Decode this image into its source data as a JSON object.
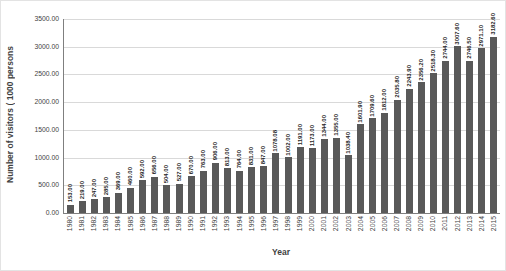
{
  "chart_data": {
    "type": "bar",
    "title": "",
    "xlabel": "Year",
    "ylabel": "Number of visitors ( 1000  persons",
    "categories": [
      "1980",
      "1981",
      "1982",
      "1983",
      "1984",
      "1985",
      "1986",
      "1987",
      "1988",
      "1989",
      "1990",
      "1991",
      "1992",
      "1993",
      "1994",
      "1995",
      "1996",
      "1997",
      "1998",
      "1999",
      "2000",
      "2001",
      "2002",
      "2003",
      "2004",
      "2005",
      "2006",
      "2007",
      "2008",
      "2009",
      "2010",
      "2011",
      "2012",
      "2013",
      "2014",
      "2015"
    ],
    "values": [
      153.0,
      219.0,
      247.0,
      285.0,
      369.0,
      460.0,
      592.0,
      656.0,
      504.0,
      527.0,
      670.0,
      763.0,
      906.0,
      813.0,
      764.0,
      831.0,
      847.0,
      1078.08,
      1002.0,
      1191.0,
      1173.0,
      1344.0,
      1355.0,
      1038.4,
      1601.9,
      1709.6,
      1812.0,
      2035.8,
      2243.9,
      2356.2,
      2518.3,
      2744.0,
      3007.6,
      2746.5,
      2971.1,
      3182.6
    ],
    "bar_labels": [
      "153.00",
      "219.00",
      "247.00",
      "285.00",
      "369.00",
      "460.00",
      "592.00",
      "656.00",
      "504.00",
      "527.00",
      "670.00",
      "763.00",
      "906.00",
      "813.00",
      "764.00",
      "831.00",
      "847.00",
      "1078.08",
      "1002.00",
      "1191.00",
      "1173.00",
      "1344.00",
      "1355.00",
      "1038.40",
      "1601.90",
      "1709.60",
      "1812.00",
      "2035.80",
      "2243.90",
      "2356.20",
      "2518.30",
      "2744.00",
      "3007.60",
      "2746.50",
      "2971.10",
      "3182.60"
    ],
    "ylim": [
      0,
      3500
    ],
    "ytick_step": 500,
    "ytick_labels": [
      "3500.00",
      "3000.00",
      "2500.00",
      "2000.00",
      "1500.00",
      "1000.00",
      "500.00",
      "0.00"
    ],
    "grid": true,
    "legend": "none",
    "bar_color": "#595959",
    "gridline_color": "#d9d9d9",
    "axis_color": "#7f7f7f",
    "label_color": "#262626"
  }
}
